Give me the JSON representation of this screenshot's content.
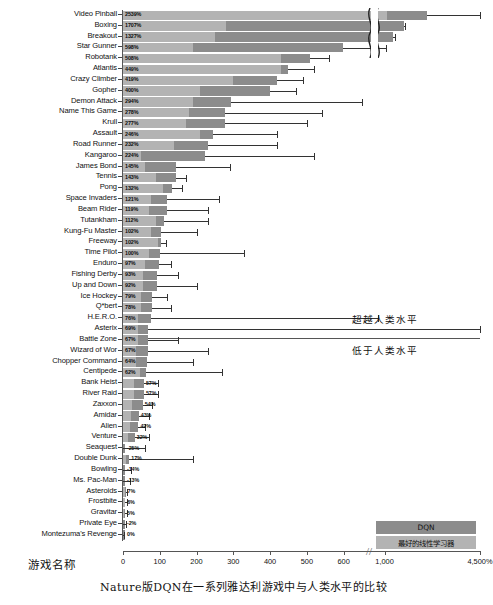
{
  "caption": "Nature版DQN在一系列雅达利游戏中与人类水平的比较",
  "axes": {
    "ylabel": "游戏名称",
    "xlabel": "",
    "xticks": [
      "0",
      "100",
      "200",
      "300",
      "400",
      "500",
      "600",
      "1,000",
      "4,500%"
    ],
    "break_symbol": "//"
  },
  "annotations": {
    "above_human": "超越人类水平",
    "below_human": "低于人类水平"
  },
  "legend": {
    "dqn": "DQN",
    "linear": "最好的线性学习器",
    "dqn_color": "#8c8c8c",
    "linear_color": "#b3b3b3"
  },
  "chart_data": {
    "type": "bar",
    "orientation": "horizontal",
    "title": "Nature版DQN在一系列雅达利游戏中与人类水平的比较",
    "xlabel": "归一化得分 (%)",
    "ylabel": "游戏名称",
    "xlim": [
      0,
      4500
    ],
    "grid": false,
    "legend_position": "bottom-right",
    "human_level": 100,
    "axis_break_at": 650,
    "series": [
      {
        "name": "DQN",
        "color": "#8c8c8c"
      },
      {
        "name": "最好的线性学习器",
        "color": "#b3b3b3"
      }
    ],
    "categories": [
      "Video Pinball",
      "Boxing",
      "Breakout",
      "Star Gunner",
      "Robotank",
      "Atlantis",
      "Crazy Climber",
      "Gopher",
      "Demon Attack",
      "Name This Game",
      "Krull",
      "Assault",
      "Road Runner",
      "Kangaroo",
      "James Bond",
      "Tennis",
      "Pong",
      "Space Invaders",
      "Beam Rider",
      "Tutankham",
      "Kung-Fu Master",
      "Freeway",
      "Time Pilot",
      "Enduro",
      "Fishing Derby",
      "Up and Down",
      "Ice Hockey",
      "Q*bert",
      "H.E.R.O.",
      "Asterix",
      "Battle Zone",
      "Wizard of Wor",
      "Chopper Command",
      "Centipede",
      "Bank Heist",
      "River Raid",
      "Zaxxon",
      "Amidar",
      "Alien",
      "Venture",
      "Seaquest",
      "Double Dunk",
      "Bowling",
      "Ms. Pac-Man",
      "Asteroids",
      "Frostbite",
      "Gravitar",
      "Private Eye",
      "Montezuma's Revenge"
    ],
    "values": [
      2539,
      1707,
      1327,
      598,
      508,
      449,
      419,
      400,
      294,
      278,
      277,
      246,
      232,
      224,
      145,
      143,
      132,
      121,
      119,
      112,
      102,
      102,
      100,
      97,
      93,
      92,
      79,
      78,
      76,
      69,
      67,
      67,
      64,
      62,
      57,
      57,
      54,
      43,
      42,
      32,
      -25,
      17,
      -14,
      -13,
      7,
      6,
      5,
      -2,
      0
    ],
    "value_labels": [
      "2539%",
      "1707%",
      "1327%",
      "598%",
      "508%",
      "449%",
      "419%",
      "400%",
      "294%",
      "278%",
      "277%",
      "246%",
      "232%",
      "224%",
      "145%",
      "143%",
      "132%",
      "121%",
      "119%",
      "112%",
      "102%",
      "102%",
      "100%",
      "97%",
      "93%",
      "92%",
      "79%",
      "78%",
      "76%",
      "69%",
      "67%",
      "67%",
      "64%",
      "62%",
      "57%",
      "57%",
      "54%",
      "43%",
      "42%",
      "32%",
      "-25%",
      "17%",
      "-14%",
      "-13%",
      "7%",
      "6%",
      "5%",
      "-2%",
      "0%"
    ],
    "linear_learner_values": [
      1100,
      280,
      250,
      190,
      430,
      430,
      300,
      210,
      190,
      180,
      170,
      210,
      140,
      50,
      60,
      90,
      110,
      75,
      70,
      90,
      75,
      95,
      70,
      60,
      55,
      55,
      50,
      50,
      40,
      40,
      40,
      35,
      35,
      45,
      30,
      30,
      25,
      22,
      20,
      14,
      8,
      7,
      6,
      6,
      5,
      5,
      4,
      3,
      2
    ],
    "error_high": [
      4500,
      1760,
      1400,
      1050,
      560,
      520,
      490,
      470,
      650,
      540,
      500,
      420,
      420,
      520,
      290,
      170,
      160,
      260,
      230,
      230,
      200,
      118,
      330,
      130,
      150,
      200,
      120,
      130,
      760,
      4500,
      150,
      230,
      190,
      270,
      95,
      95,
      80,
      70,
      60,
      72,
      60,
      190,
      22,
      20,
      12,
      11,
      10,
      8,
      4
    ]
  }
}
